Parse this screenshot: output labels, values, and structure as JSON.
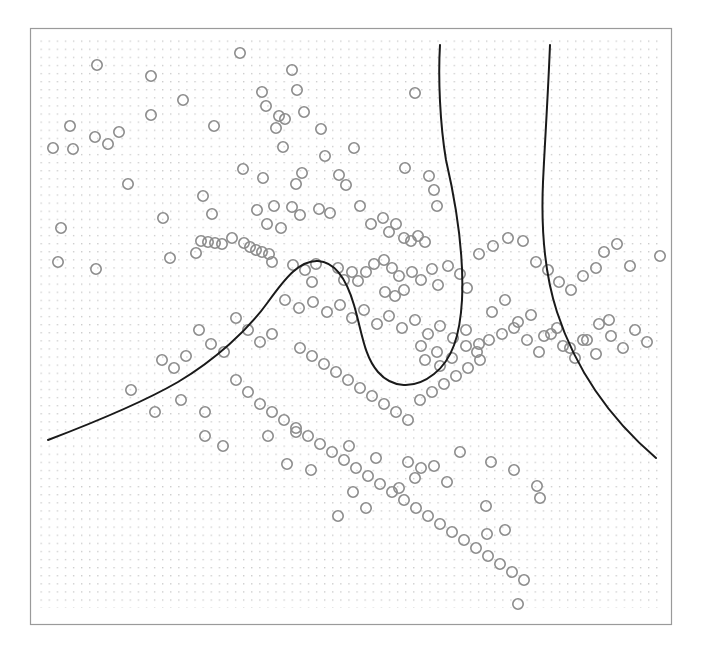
{
  "figure": {
    "background_color": "#ffffff",
    "frame": {
      "x": 30,
      "y": 28,
      "width": 642,
      "height": 597,
      "border_color": "#9a9a9a",
      "border_width": 1.2,
      "fill_color": "#ffffff"
    }
  },
  "chart_data": {
    "type": "scatter",
    "title": "",
    "subtitle": "",
    "xlabel": "",
    "ylabel": "",
    "xlim": [
      0,
      1
    ],
    "ylim": [
      0,
      1
    ],
    "grid": true,
    "grid_style": "dotted-point-lattice",
    "grid_color": "#c9c9c9",
    "grid_spacing_px": 8.1,
    "legend": null,
    "tick_labels": {
      "x": [],
      "y": []
    },
    "annotations": [],
    "series": [
      {
        "name": "observations",
        "type": "scatter",
        "marker": "open-circle",
        "marker_color": "#8c8c8c",
        "marker_radius_px": 5.2,
        "marker_stroke_px": 1.6,
        "points": [
          [
            97,
            65
          ],
          [
            151,
            76
          ],
          [
            240,
            53
          ],
          [
            292,
            70
          ],
          [
            183,
            100
          ],
          [
            262,
            92
          ],
          [
            297,
            90
          ],
          [
            266,
            106
          ],
          [
            304,
            112
          ],
          [
            151,
            115
          ],
          [
            279,
            116
          ],
          [
            285,
            119
          ],
          [
            415,
            93
          ],
          [
            70,
            126
          ],
          [
            95,
            137
          ],
          [
            119,
            132
          ],
          [
            276,
            128
          ],
          [
            321,
            129
          ],
          [
            73,
            149
          ],
          [
            53,
            148
          ],
          [
            108,
            144
          ],
          [
            283,
            147
          ],
          [
            325,
            156
          ],
          [
            354,
            148
          ],
          [
            339,
            175
          ],
          [
            243,
            169
          ],
          [
            203,
            196
          ],
          [
            263,
            178
          ],
          [
            302,
            173
          ],
          [
            296,
            184
          ],
          [
            346,
            185
          ],
          [
            405,
            168
          ],
          [
            429,
            176
          ],
          [
            434,
            190
          ],
          [
            437,
            206
          ],
          [
            163,
            218
          ],
          [
            212,
            214
          ],
          [
            257,
            210
          ],
          [
            274,
            206
          ],
          [
            292,
            207
          ],
          [
            267,
            224
          ],
          [
            281,
            228
          ],
          [
            300,
            215
          ],
          [
            232,
            238
          ],
          [
            244,
            243
          ],
          [
            250,
            247
          ],
          [
            256,
            250
          ],
          [
            262,
            252
          ],
          [
            269,
            254
          ],
          [
            201,
            241
          ],
          [
            208,
            242
          ],
          [
            215,
            243
          ],
          [
            222,
            244
          ],
          [
            319,
            209
          ],
          [
            330,
            213
          ],
          [
            360,
            206
          ],
          [
            371,
            224
          ],
          [
            383,
            218
          ],
          [
            389,
            232
          ],
          [
            396,
            224
          ],
          [
            404,
            238
          ],
          [
            411,
            241
          ],
          [
            418,
            236
          ],
          [
            425,
            242
          ],
          [
            58,
            262
          ],
          [
            96,
            269
          ],
          [
            196,
            253
          ],
          [
            272,
            262
          ],
          [
            293,
            265
          ],
          [
            305,
            270
          ],
          [
            316,
            264
          ],
          [
            312,
            282
          ],
          [
            338,
            268
          ],
          [
            344,
            280
          ],
          [
            352,
            272
          ],
          [
            358,
            281
          ],
          [
            366,
            272
          ],
          [
            374,
            264
          ],
          [
            384,
            260
          ],
          [
            392,
            268
          ],
          [
            399,
            276
          ],
          [
            404,
            290
          ],
          [
            395,
            296
          ],
          [
            385,
            292
          ],
          [
            412,
            272
          ],
          [
            421,
            280
          ],
          [
            432,
            269
          ],
          [
            438,
            285
          ],
          [
            448,
            266
          ],
          [
            460,
            274
          ],
          [
            467,
            288
          ],
          [
            479,
            254
          ],
          [
            493,
            246
          ],
          [
            508,
            238
          ],
          [
            523,
            241
          ],
          [
            536,
            262
          ],
          [
            548,
            270
          ],
          [
            559,
            282
          ],
          [
            571,
            290
          ],
          [
            583,
            276
          ],
          [
            596,
            268
          ],
          [
            604,
            252
          ],
          [
            617,
            244
          ],
          [
            630,
            266
          ],
          [
            660,
            256
          ],
          [
            285,
            300
          ],
          [
            299,
            308
          ],
          [
            313,
            302
          ],
          [
            327,
            312
          ],
          [
            340,
            305
          ],
          [
            352,
            318
          ],
          [
            364,
            310
          ],
          [
            377,
            324
          ],
          [
            389,
            316
          ],
          [
            402,
            328
          ],
          [
            415,
            320
          ],
          [
            428,
            334
          ],
          [
            440,
            326
          ],
          [
            453,
            338
          ],
          [
            466,
            330
          ],
          [
            479,
            344
          ],
          [
            492,
            312
          ],
          [
            505,
            300
          ],
          [
            518,
            322
          ],
          [
            531,
            315
          ],
          [
            544,
            336
          ],
          [
            557,
            328
          ],
          [
            570,
            348
          ],
          [
            583,
            340
          ],
          [
            596,
            354
          ],
          [
            609,
            320
          ],
          [
            236,
            318
          ],
          [
            248,
            330
          ],
          [
            260,
            342
          ],
          [
            272,
            334
          ],
          [
            199,
            330
          ],
          [
            211,
            344
          ],
          [
            224,
            352
          ],
          [
            186,
            356
          ],
          [
            174,
            368
          ],
          [
            162,
            360
          ],
          [
            300,
            348
          ],
          [
            312,
            356
          ],
          [
            324,
            364
          ],
          [
            336,
            372
          ],
          [
            348,
            380
          ],
          [
            360,
            388
          ],
          [
            372,
            396
          ],
          [
            384,
            404
          ],
          [
            396,
            412
          ],
          [
            408,
            420
          ],
          [
            420,
            400
          ],
          [
            432,
            392
          ],
          [
            444,
            384
          ],
          [
            456,
            376
          ],
          [
            468,
            368
          ],
          [
            480,
            360
          ],
          [
            236,
            380
          ],
          [
            248,
            392
          ],
          [
            260,
            404
          ],
          [
            272,
            412
          ],
          [
            284,
            420
          ],
          [
            296,
            428
          ],
          [
            308,
            436
          ],
          [
            320,
            444
          ],
          [
            332,
            452
          ],
          [
            344,
            460
          ],
          [
            356,
            468
          ],
          [
            368,
            476
          ],
          [
            380,
            484
          ],
          [
            392,
            492
          ],
          [
            404,
            500
          ],
          [
            416,
            508
          ],
          [
            428,
            516
          ],
          [
            440,
            524
          ],
          [
            452,
            532
          ],
          [
            464,
            540
          ],
          [
            476,
            548
          ],
          [
            488,
            556
          ],
          [
            500,
            564
          ],
          [
            512,
            572
          ],
          [
            524,
            580
          ],
          [
            518,
            604
          ],
          [
            205,
            436
          ],
          [
            223,
            446
          ],
          [
            268,
            436
          ],
          [
            296,
            432
          ],
          [
            349,
            446
          ],
          [
            376,
            458
          ],
          [
            408,
            462
          ],
          [
            421,
            468
          ],
          [
            434,
            466
          ],
          [
            460,
            452
          ],
          [
            491,
            462
          ],
          [
            514,
            470
          ],
          [
            537,
            486
          ],
          [
            415,
            478
          ],
          [
            447,
            482
          ],
          [
            353,
            492
          ],
          [
            338,
            516
          ],
          [
            287,
            464
          ],
          [
            311,
            470
          ],
          [
            366,
            508
          ],
          [
            399,
            488
          ],
          [
            486,
            506
          ],
          [
            505,
            530
          ],
          [
            540,
            498
          ],
          [
            487,
            534
          ],
          [
            131,
            390
          ],
          [
            181,
            400
          ],
          [
            205,
            412
          ],
          [
            155,
            412
          ],
          [
            421,
            346
          ],
          [
            437,
            352
          ],
          [
            425,
            360
          ],
          [
            440,
            366
          ],
          [
            452,
            358
          ],
          [
            466,
            346
          ],
          [
            477,
            352
          ],
          [
            489,
            340
          ],
          [
            502,
            334
          ],
          [
            514,
            328
          ],
          [
            527,
            340
          ],
          [
            539,
            352
          ],
          [
            551,
            334
          ],
          [
            563,
            346
          ],
          [
            575,
            358
          ],
          [
            587,
            340
          ],
          [
            599,
            324
          ],
          [
            611,
            336
          ],
          [
            623,
            348
          ],
          [
            635,
            330
          ],
          [
            647,
            342
          ],
          [
            170,
            258
          ],
          [
            61,
            228
          ],
          [
            128,
            184
          ],
          [
            214,
            126
          ]
        ]
      }
    ],
    "decision_boundary": {
      "name": "contour-boundary",
      "stroke_color": "#1a1a1a",
      "stroke_width_px": 2.0,
      "branches": [
        {
          "id": "left-hook-branch",
          "path": "M 48 440 C 90 424 140 404 178 382 C 215 360 248 330 268 302 C 286 277 300 260 318 261 C 336 262 347 281 354 305 C 362 332 364 356 378 372 C 392 388 414 390 434 374 C 452 360 460 336 462 300 C 464 258 458 212 446 160 C 440 124 438 78 440 45"
        },
        {
          "id": "right-branch",
          "path": "M 550 45 C 548 95 545 140 543 182 C 541 228 544 272 557 312 C 572 358 600 410 656 458"
        }
      ]
    }
  }
}
